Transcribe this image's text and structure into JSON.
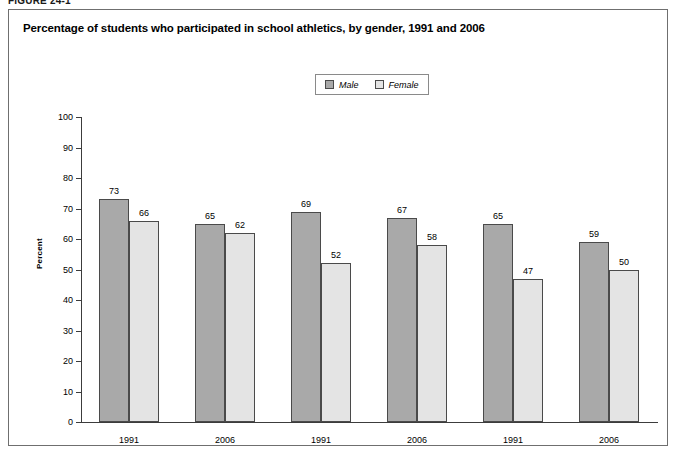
{
  "figure": {
    "label": "FIGURE 24-1"
  },
  "chart_title": "Percentage of students who participated in school athletics, by gender, 1991 and 2006",
  "legend": {
    "items": [
      {
        "label": "Male",
        "color": "#a9a9a9"
      },
      {
        "label": "Female",
        "color": "#e4e4e4"
      }
    ]
  },
  "axis": {
    "y_title": "Percent",
    "y_ticks": [
      "0",
      "10",
      "20",
      "30",
      "40",
      "50",
      "60",
      "70",
      "80",
      "90",
      "100"
    ]
  },
  "chart_data": {
    "type": "bar",
    "title": "Percentage of students who participated in school athletics, by gender, 1991 and 2006",
    "xlabel": "",
    "ylabel": "Percent",
    "ylim": [
      0,
      100
    ],
    "ytick_step": 10,
    "grid": false,
    "legend_position": "top-center",
    "categories": [
      "1991",
      "2006",
      "1991",
      "2006",
      "1991",
      "2006"
    ],
    "groups": [
      {
        "name": "Eighth grade",
        "categories": [
          "1991",
          "2006"
        ]
      },
      {
        "name": "Tenth grade",
        "categories": [
          "1991",
          "2006"
        ]
      },
      {
        "name": "Twelfth grade",
        "categories": [
          "1991",
          "2006"
        ]
      }
    ],
    "series": [
      {
        "name": "Male",
        "color": "#a9a9a9",
        "values": [
          73,
          65,
          69,
          67,
          65,
          59
        ]
      },
      {
        "name": "Female",
        "color": "#e4e4e4",
        "values": [
          66,
          62,
          52,
          58,
          47,
          50
        ]
      }
    ]
  }
}
